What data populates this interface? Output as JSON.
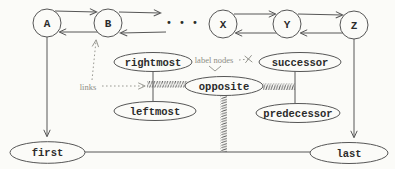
{
  "colors": {
    "ink": "#565656",
    "annotation_ink": "#8d8d85",
    "background": "#fbfbf8",
    "label_text": "#2b2b2b"
  },
  "list_nodes": {
    "a": "A",
    "b": "B",
    "x": "X",
    "y": "Y",
    "z": "Z"
  },
  "ellipsis": "• • •",
  "pointers": {
    "rightmost": "rightmost",
    "successor": "successor",
    "opposite": "opposite",
    "leftmost": "leftmost",
    "predecessor": "predecessor",
    "first": "first",
    "last": "last"
  },
  "annotations": {
    "label_nodes": "label nodes",
    "links": "links"
  }
}
